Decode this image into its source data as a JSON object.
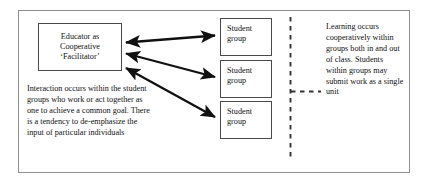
{
  "figure": {
    "educator_box": {
      "lines": [
        "Educator as",
        "Cooperative",
        "‘Facilitator’"
      ]
    },
    "student_boxes": [
      {
        "line1": "Student",
        "line2": "group"
      },
      {
        "line1": "Student",
        "line2": "group"
      },
      {
        "line1": "Student",
        "line2": "group"
      }
    ],
    "left_note": "Interaction occurs within the student groups who work or act together as one to achieve a common goal. There is a tendency to de-emphasize the input of particular individuals",
    "right_note": "Learning occurs cooperatively within groups both in and out of class. Students within groups may submit work as a single unit",
    "connectors": {
      "arrow_1": "double-headed-arrow",
      "arrow_2": "double-headed-arrow",
      "arrow_3": "double-headed-arrow",
      "divider_vertical": "dashed-vertical-divider",
      "divider_branch": "dashed-horizontal-branch"
    },
    "colors": {
      "frame": "#8f8f8f",
      "box_border": "#4a4a4a",
      "arrow": "#111111",
      "dashed": "#333333",
      "text": "#111111",
      "background": "#ffffff"
    }
  }
}
